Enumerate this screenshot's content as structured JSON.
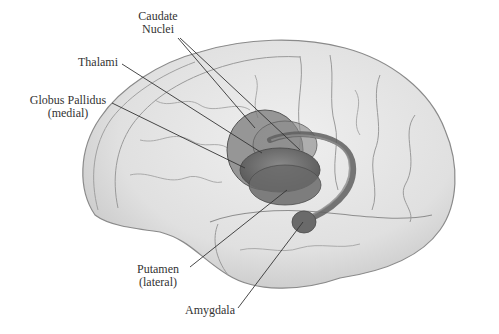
{
  "diagram": {
    "labels": [
      {
        "id": "caudate",
        "lines": [
          "Caudate",
          "Nuclei"
        ]
      },
      {
        "id": "thalami",
        "lines": [
          "Thalami"
        ]
      },
      {
        "id": "globus",
        "lines": [
          "Globus Pallidus",
          "(medial)"
        ]
      },
      {
        "id": "putamen",
        "lines": [
          "Putamen",
          "(lateral)"
        ]
      },
      {
        "id": "amygdala",
        "lines": [
          "Amygdala"
        ]
      }
    ],
    "colors": {
      "brain_fill": "#e4e4e4",
      "brain_outline": "#8a8a8a",
      "sulci": "#9a9a9a",
      "structures": "#6e6e6e",
      "structures_dark": "#555555",
      "leader_lines": "#333333",
      "text": "#333333"
    }
  }
}
